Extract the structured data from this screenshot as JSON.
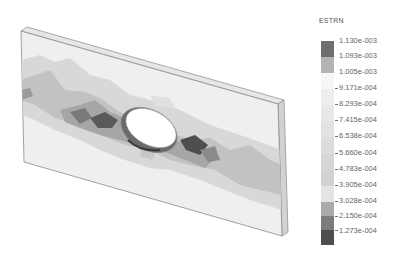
{
  "legend": {
    "title": "ESTRN",
    "labels": [
      "1.130e-003",
      "1.093e-003",
      "1.005e-003",
      "9.171e-004",
      "8.293e-004",
      "7.415e-004",
      "6.538e-004",
      "5.660e-004",
      "4.783e-004",
      "3.905e-004",
      "3.028e-004",
      "2.150e-004",
      "1.273e-004"
    ],
    "swatch_colors": [
      "#6e6e6e",
      "#b4b4b4",
      "#f6f6f6",
      "#eeeeee",
      "#e8e8e8",
      "#e2e2e2",
      "#dcdcdc",
      "#d6d6d6",
      "#d2d2d2",
      "#ababab",
      "#7c7c7c",
      "#4e4e4e"
    ]
  },
  "model": {
    "name": "plate-with-hole",
    "colors": {
      "plate_face": "#efefef",
      "plate_edge": "#dcdcdc",
      "outline": "#8a8a8a",
      "band_light": "#d4d4d4",
      "band_mid": "#b4b4b4",
      "band_dark": "#7a7a7a",
      "band_darkest": "#4e4e4e"
    }
  }
}
